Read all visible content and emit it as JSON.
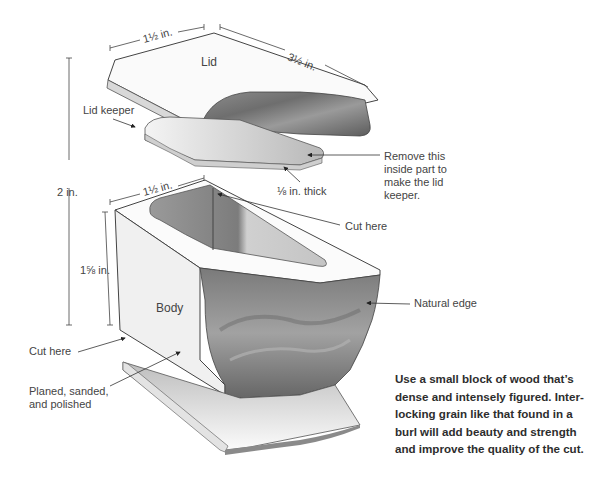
{
  "diagram": {
    "parts": {
      "lid": "Lid",
      "lid_keeper": "Lid keeper",
      "body": "Body"
    },
    "dimensions": {
      "lid_width": "1½ in.",
      "lid_length": "3½ in.",
      "body_width": "1½ in.",
      "overall_height": "2 in.",
      "body_height": "1⅝ in.",
      "keeper_thickness": "⅛ in. thick"
    },
    "callouts": {
      "remove_inside": [
        "Remove this",
        "inside part to",
        "make the lid",
        "keeper."
      ],
      "cut_here_top": "Cut here",
      "natural_edge": "Natural edge",
      "cut_here_bottom": "Cut here",
      "planed": [
        "Planed, sanded,",
        "and polished"
      ]
    },
    "caption_lines": [
      "Use a small block of wood that’s",
      "dense and intensely figured. Inter-",
      "locking grain like that found in a",
      "burl will add beauty and strength",
      "and improve the quality of the cut."
    ]
  }
}
